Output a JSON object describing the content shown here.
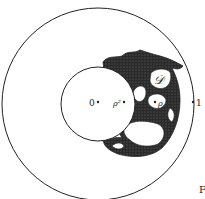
{
  "figure": {
    "labels": {
      "origin": "0",
      "rho_squared": "ρ²",
      "rho": "ρ",
      "one": "1",
      "domain": "𝒟",
      "caption_fragment": "F"
    },
    "colors": {
      "ink": "#222222",
      "background": "#ffffff"
    }
  }
}
